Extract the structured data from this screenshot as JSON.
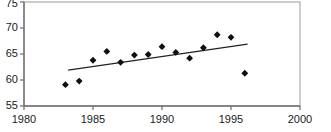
{
  "chart_data": {
    "type": "scatter",
    "title": "",
    "xlabel": "",
    "ylabel": "",
    "xlim": [
      1980,
      2000
    ],
    "ylim": [
      55,
      75
    ],
    "xticks": [
      1980,
      1985,
      1990,
      1995,
      2000
    ],
    "yticks": [
      55,
      60,
      65,
      70,
      75
    ],
    "grid": false,
    "legend": null,
    "x": [
      1983,
      1984,
      1985,
      1986,
      1987,
      1988,
      1989,
      1990,
      1991,
      1992,
      1993,
      1994,
      1995,
      1996
    ],
    "values": [
      59.1,
      59.8,
      63.8,
      65.5,
      63.4,
      64.8,
      64.9,
      66.4,
      65.3,
      64.2,
      66.2,
      68.7,
      68.2,
      61.3
    ],
    "series": [
      {
        "name": "observations",
        "type": "scatter",
        "marker": "diamond",
        "color": "#111111",
        "x": [
          1983,
          1984,
          1985,
          1986,
          1987,
          1988,
          1989,
          1990,
          1991,
          1992,
          1993,
          1994,
          1995,
          1996
        ],
        "values": [
          59.1,
          59.8,
          63.8,
          65.5,
          63.4,
          64.8,
          64.9,
          66.4,
          65.3,
          64.2,
          66.2,
          68.7,
          68.2,
          61.3
        ]
      },
      {
        "name": "trend-line",
        "type": "line",
        "color": "#222222",
        "x": [
          1983.2,
          1996.2
        ],
        "values": [
          61.9,
          66.9
        ]
      }
    ],
    "axis_color": "#6e6e6e",
    "frame_color": "#9a9a9a",
    "tick_labels_x": [
      "1980",
      "1985",
      "1990",
      "1995",
      "2000"
    ],
    "tick_labels_y": [
      "55",
      "60",
      "65",
      "70",
      "75"
    ]
  },
  "ticks": {
    "y": {
      "t55": "55",
      "t60": "60",
      "t65": "65",
      "t70": "70",
      "t75": "75"
    },
    "x": {
      "t1980": "1980",
      "t1985": "1985",
      "t1990": "1990",
      "t1995": "1995",
      "t2000": "2000"
    }
  }
}
